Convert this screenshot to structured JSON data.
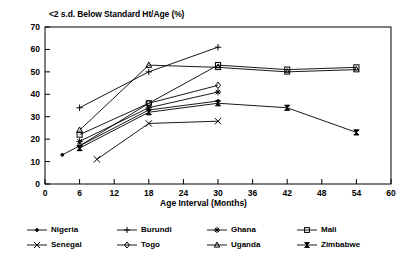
{
  "chart_data": {
    "type": "line",
    "title": "<2 s.d. Below Standard Ht/Age (%)",
    "xlabel": "Age Interval (Months)",
    "ylabel": "",
    "xlim": [
      0,
      60
    ],
    "ylim": [
      0,
      70
    ],
    "xticks": [
      0,
      6,
      12,
      18,
      24,
      30,
      36,
      42,
      48,
      54,
      60
    ],
    "yticks": [
      0,
      10,
      20,
      30,
      40,
      50,
      60,
      70
    ],
    "grid": false,
    "legend_position": "below",
    "series": [
      {
        "name": "Nigeria",
        "marker": "dot",
        "x": [
          3,
          18,
          30
        ],
        "y": [
          13,
          33,
          37
        ]
      },
      {
        "name": "Burundi",
        "marker": "plus",
        "x": [
          6,
          18,
          30
        ],
        "y": [
          34,
          50,
          61
        ]
      },
      {
        "name": "Ghana",
        "marker": "asterisk",
        "x": [
          6,
          18,
          30
        ],
        "y": [
          19,
          34,
          41
        ]
      },
      {
        "name": "Mali",
        "marker": "square",
        "x": [
          6,
          18,
          30,
          42,
          54
        ],
        "y": [
          22,
          36,
          53,
          51,
          52
        ]
      },
      {
        "name": "Senegal",
        "marker": "ex",
        "x": [
          9,
          18,
          30
        ],
        "y": [
          11,
          27,
          28
        ]
      },
      {
        "name": "Togo",
        "marker": "diamond",
        "x": [
          6,
          18,
          30
        ],
        "y": [
          17,
          36,
          44
        ]
      },
      {
        "name": "Uganda",
        "marker": "triangle",
        "x": [
          6,
          18,
          30,
          42,
          54
        ],
        "y": [
          24,
          53,
          52,
          50,
          51
        ]
      },
      {
        "name": "Zimbabwe",
        "marker": "bowtie",
        "x": [
          6,
          18,
          30,
          42,
          54
        ],
        "y": [
          16,
          32,
          36,
          34,
          23
        ]
      }
    ]
  },
  "legend": {
    "entries": [
      {
        "label": "Nigeria"
      },
      {
        "label": "Burundi"
      },
      {
        "label": "Ghana"
      },
      {
        "label": "Mali"
      },
      {
        "label": "Senegal"
      },
      {
        "label": "Togo"
      },
      {
        "label": "Uganda"
      },
      {
        "label": "Zimbabwe"
      }
    ]
  },
  "colors": {
    "foreground": "#000000",
    "background": "#ffffff"
  }
}
